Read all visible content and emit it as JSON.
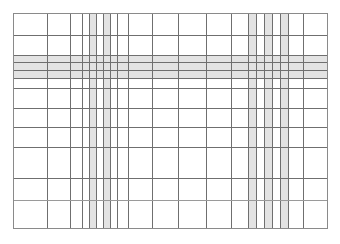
{
  "document": {
    "title": "Grid Table Wireframe",
    "kind": "table-grid",
    "background_color": "#ffffff"
  },
  "canvas": {
    "width": 340,
    "height": 244
  },
  "table": {
    "frame": {
      "left": 13,
      "top": 13,
      "right": 327,
      "bottom": 228,
      "border_color": "#8a8a8a",
      "border_width": 1
    },
    "line_color": "#6f6f6f",
    "line_color_light": "#9a9a9a",
    "line_width": 1,
    "highlight_color": "#e3e3e3",
    "column_count": 22,
    "row_count": 13,
    "column_rules": [
      {
        "x": 47,
        "weight": "normal"
      },
      {
        "x": 70,
        "weight": "normal"
      },
      {
        "x": 82,
        "weight": "normal"
      },
      {
        "x": 89,
        "weight": "normal"
      },
      {
        "x": 96,
        "weight": "normal"
      },
      {
        "x": 103,
        "weight": "normal"
      },
      {
        "x": 110,
        "weight": "normal"
      },
      {
        "x": 117,
        "weight": "normal"
      },
      {
        "x": 128,
        "weight": "normal"
      },
      {
        "x": 152,
        "weight": "normal"
      },
      {
        "x": 178,
        "weight": "normal"
      },
      {
        "x": 206,
        "weight": "normal"
      },
      {
        "x": 231,
        "weight": "normal"
      },
      {
        "x": 248,
        "weight": "normal"
      },
      {
        "x": 256,
        "weight": "normal"
      },
      {
        "x": 264,
        "weight": "normal"
      },
      {
        "x": 272,
        "weight": "normal"
      },
      {
        "x": 280,
        "weight": "normal"
      },
      {
        "x": 288,
        "weight": "normal"
      },
      {
        "x": 303,
        "weight": "normal"
      }
    ],
    "row_rules": [
      {
        "y": 35,
        "weight": "normal"
      },
      {
        "y": 55,
        "weight": "normal"
      },
      {
        "y": 62,
        "weight": "normal"
      },
      {
        "y": 70,
        "weight": "normal"
      },
      {
        "y": 78,
        "weight": "normal"
      },
      {
        "y": 88,
        "weight": "normal"
      },
      {
        "y": 108,
        "weight": "normal"
      },
      {
        "y": 127,
        "weight": "normal"
      },
      {
        "y": 147,
        "weight": "normal"
      },
      {
        "y": 178,
        "weight": "normal"
      },
      {
        "y": 200,
        "weight": "light"
      }
    ],
    "highlighted_columns": [
      {
        "x": 89,
        "width": 7
      },
      {
        "x": 103,
        "width": 8
      },
      {
        "x": 248,
        "width": 8
      },
      {
        "x": 264,
        "width": 8
      },
      {
        "x": 280,
        "width": 8
      }
    ],
    "highlighted_rows": [
      {
        "y": 55,
        "height": 7
      },
      {
        "y": 62,
        "height": 8
      },
      {
        "y": 70,
        "height": 8
      }
    ]
  }
}
